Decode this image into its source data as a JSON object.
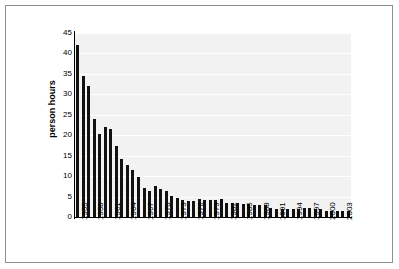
{
  "figure": {
    "border_color": "#8e8e8e",
    "background": "#ffffff",
    "plot_background": "#f2f2f2",
    "bar_color": "#111111",
    "gridline_color": "#ffffff"
  },
  "axis": {
    "y_title": "person hours",
    "y_ticks": [
      "45",
      "40",
      "35",
      "30",
      "25",
      "20",
      "15",
      "10",
      "5",
      "0"
    ],
    "x_ticks_visible": [
      "1955",
      "1958",
      "1961",
      "1964",
      "1967",
      "1970",
      "1973",
      "1976",
      "1979",
      "1982",
      "1985",
      "1988",
      "1991",
      "1994",
      "1997",
      "2000",
      "2003"
    ]
  },
  "chart_data": {
    "type": "bar",
    "title": "",
    "subtitle": "",
    "xlabel": "",
    "ylabel": "person hours",
    "ylim": [
      0,
      45
    ],
    "ytick_step": 5,
    "grid": true,
    "legend": false,
    "legend_position": "none",
    "xtick_label_rotation": -90,
    "xtick_label_interval": 3,
    "categories": [
      "1955",
      "1956",
      "1957",
      "1958",
      "1959",
      "1960",
      "1961",
      "1962",
      "1963",
      "1964",
      "1965",
      "1966",
      "1967",
      "1968",
      "1969",
      "1970",
      "1971",
      "1972",
      "1973",
      "1974",
      "1975",
      "1976",
      "1977",
      "1978",
      "1979",
      "1980",
      "1981",
      "1982",
      "1983",
      "1984",
      "1985",
      "1986",
      "1987",
      "1988",
      "1989",
      "1990",
      "1991",
      "1992",
      "1993",
      "1994",
      "1995",
      "1996",
      "1997",
      "1998",
      "1999",
      "2000",
      "2001",
      "2002",
      "2003",
      "2004"
    ],
    "values": [
      42.0,
      34.5,
      32.0,
      24.0,
      20.3,
      22.0,
      21.6,
      17.4,
      14.2,
      12.6,
      11.4,
      9.7,
      7.0,
      6.3,
      7.5,
      6.9,
      6.3,
      5.2,
      4.6,
      4.2,
      3.8,
      3.8,
      4.3,
      4.1,
      4.1,
      4.2,
      4.3,
      3.5,
      3.5,
      3.4,
      3.2,
      3.1,
      2.9,
      3.0,
      2.9,
      2.2,
      2.0,
      2.0,
      2.0,
      2.0,
      2.0,
      2.1,
      2.1,
      2.0,
      1.9,
      1.5,
      1.5,
      1.5,
      1.5,
      1.5
    ]
  }
}
